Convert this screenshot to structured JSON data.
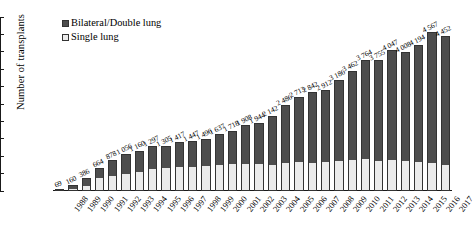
{
  "chart_data": {
    "type": "bar",
    "subtype": "stacked-bar",
    "title": "",
    "xlabel": "",
    "ylabel": "Number of transplants",
    "ylim": [
      0,
      5000
    ],
    "ytick_step": 500,
    "ytick_labels": [
      "0",
      "500",
      "1 000",
      "1 500",
      "2 000",
      "2 500",
      "3 000",
      "3 500",
      "4 000",
      "4 500",
      "5 000"
    ],
    "grid": false,
    "legend_position": "top-left",
    "legend": [
      "Bilateral/Double lung",
      "Single lung"
    ],
    "colors": {
      "bilateral_double_lung": "#4d4d4d",
      "single_lung": "#ebebeb",
      "axis": "#1a1a1a",
      "text": "#000000"
    },
    "categories": [
      "1988",
      "1989",
      "1990",
      "1991",
      "1992",
      "1993",
      "1994",
      "1995",
      "1996",
      "1997",
      "1998",
      "1999",
      "2000",
      "2001",
      "2002",
      "2003",
      "2004",
      "2005",
      "2006",
      "2007",
      "2008",
      "2009",
      "2010",
      "2011",
      "2012",
      "2013",
      "2014",
      "2015",
      "2016",
      "2017"
    ],
    "series": [
      {
        "name": "Single lung",
        "values": [
          33,
          86,
          186,
          396,
          474,
          520,
          588,
          660,
          676,
          708,
          730,
          744,
          780,
          818,
          806,
          800,
          788,
          838,
          862,
          848,
          866,
          890,
          920,
          944,
          904,
          928,
          898,
          872,
          824,
          772
        ]
      },
      {
        "name": "Bilateral/Double lung",
        "values": [
          36,
          74,
          200,
          268,
          404,
          536,
          572,
          637,
          629,
          709,
          717,
          752,
          857,
          900,
          1102,
          1144,
          1354,
          1648,
          1851,
          1994,
          2046,
          2296,
          2542,
          2820,
          2851,
          3119,
          3110,
          3322,
          3743,
          3680
        ]
      }
    ],
    "totals": [
      69,
      160,
      386,
      664,
      878,
      1056,
      1160,
      1297,
      1305,
      1417,
      1447,
      1496,
      1637,
      1718,
      1908,
      1944,
      2142,
      2486,
      2713,
      2842,
      2912,
      3186,
      3462,
      3764,
      3755,
      4047,
      4008,
      4194,
      4567,
      4452
    ],
    "total_labels": [
      "69",
      "160",
      "386",
      "664",
      "878",
      "1 056",
      "1 160",
      "1 297",
      "1 305",
      "1 417",
      "1 447",
      "1 496",
      "1 637",
      "1 718",
      "1 908",
      "1 944",
      "2 142",
      "2 486",
      "2 713",
      "2 842",
      "2 912",
      "3 186",
      "3 462",
      "3 764",
      "3 755",
      "4 047",
      "4 008",
      "4 194",
      "4 567",
      "4 452"
    ]
  },
  "legend": {
    "items": [
      {
        "label": "Bilateral/Double lung",
        "swatch": "dark-square-swatch"
      },
      {
        "label": "Single lung",
        "swatch": "light-square-swatch"
      }
    ]
  },
  "axes": {
    "y_title": "Number of transplants"
  }
}
